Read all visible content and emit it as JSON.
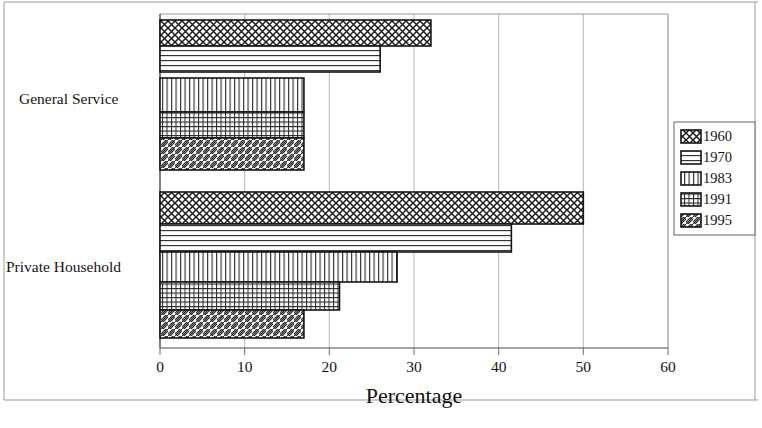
{
  "chart_data": {
    "type": "bar",
    "orientation": "horizontal",
    "title": "",
    "xlabel": "Percentage",
    "ylabel": "",
    "xlim": [
      0,
      60
    ],
    "xticks": [
      0,
      10,
      20,
      30,
      40,
      50,
      60
    ],
    "grid": true,
    "legend_position": "right",
    "categories": [
      "General Service",
      "Private Household"
    ],
    "series": [
      {
        "name": "1960",
        "pattern": "crosshatch-diagonal",
        "values": [
          32.0,
          50.0
        ]
      },
      {
        "name": "1970",
        "pattern": "horizontal-lines",
        "values": [
          26.0,
          41.5
        ]
      },
      {
        "name": "1983",
        "pattern": "vertical-lines",
        "values": [
          17.0,
          28.0
        ]
      },
      {
        "name": "1991",
        "pattern": "grid-fine",
        "values": [
          17.0,
          21.2
        ]
      },
      {
        "name": "1995",
        "pattern": "diagonal-lines",
        "values": [
          17.0,
          17.0
        ]
      }
    ]
  },
  "axis": {
    "x_tick_labels": [
      "0",
      "10",
      "20",
      "30",
      "40",
      "50",
      "60"
    ],
    "x_axis_title": "Percentage",
    "category_labels": [
      "General Service",
      "Private Household"
    ]
  },
  "legend": {
    "entries": [
      {
        "label": "1960",
        "swatch": "crosshatch-diagonal-swatch"
      },
      {
        "label": "1970",
        "swatch": "horizontal-lines-swatch"
      },
      {
        "label": "1983",
        "swatch": "vertical-lines-swatch"
      },
      {
        "label": "1991",
        "swatch": "grid-fine-swatch"
      },
      {
        "label": "1995",
        "swatch": "diagonal-lines-swatch"
      }
    ]
  },
  "colors": {
    "background": "#ffffff",
    "ink": "#141414",
    "gridline": "#b4b4b4",
    "frame": "#9a9a9a"
  }
}
